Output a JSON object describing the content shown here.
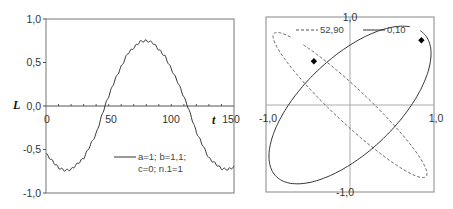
{
  "chart_data": [
    {
      "type": "line",
      "title": "",
      "xlabel": "t",
      "ylabel": "L",
      "xlim": [
        0,
        150
      ],
      "ylim": [
        -1.0,
        1.0
      ],
      "x_ticks": [
        "0",
        "50",
        "100",
        "150"
      ],
      "y_ticks": [
        "1,0",
        "0,5",
        "0,0",
        "-0,5",
        "-1,0"
      ],
      "grid": false,
      "legend_position": "lower-center",
      "series": [
        {
          "name": "a=1; b=1,1; c=0; n.1=1",
          "legend_lines": [
            "a=1; b=1,1;",
            "c=0; n.1=1"
          ],
          "style": "solid",
          "color": "#333333",
          "x": [
            0,
            10,
            15,
            20,
            30,
            40,
            47,
            55,
            65,
            75,
            80,
            85,
            95,
            105,
            113,
            120,
            130,
            140,
            145,
            150
          ],
          "values": [
            -0.55,
            -0.71,
            -0.74,
            -0.73,
            -0.6,
            -0.32,
            0.0,
            0.3,
            0.6,
            0.74,
            0.75,
            0.73,
            0.57,
            0.28,
            0.0,
            -0.3,
            -0.6,
            -0.72,
            -0.73,
            -0.7
          ]
        }
      ]
    },
    {
      "type": "line",
      "subtype": "parametric",
      "title": "",
      "xlim": [
        -1.0,
        1.0
      ],
      "ylim": [
        -1.0,
        1.0
      ],
      "x_ticks": [
        "-1,0",
        "1,0"
      ],
      "y_ticks": [
        "1,0",
        "-1,0"
      ],
      "grid": false,
      "legend_position": "top",
      "series": [
        {
          "name": "52,90",
          "style": "dashed",
          "color": "#555555",
          "shape": "ellipse",
          "center": [
            0.0,
            0.0
          ],
          "semi_major": 1.22,
          "semi_minor": 0.2,
          "angle_deg": -42,
          "marker": [
            -0.43,
            0.5
          ]
        },
        {
          "name": "0,10",
          "style": "solid",
          "color": "#333333",
          "shape": "ellipse",
          "center": [
            0.0,
            0.0
          ],
          "semi_major": 1.2,
          "semi_minor": 0.55,
          "angle_deg": 42,
          "marker": [
            0.85,
            0.74
          ]
        }
      ]
    }
  ]
}
